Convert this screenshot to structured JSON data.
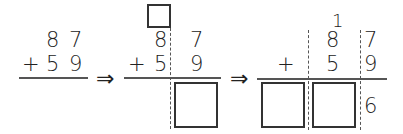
{
  "panel1": {
    "top_digits": [
      "8",
      "7"
    ],
    "operator": "+",
    "bottom_digits": [
      "5",
      "9"
    ]
  },
  "arrow1": "⇒",
  "panel2": {
    "carry_box": "",
    "top_digits": [
      "8",
      "7"
    ],
    "operator": "+",
    "bottom_digits": [
      "5",
      "9"
    ],
    "answer_box": ""
  },
  "arrow2": "⇒",
  "panel3": {
    "carry": "1",
    "top_digits": [
      "8",
      "7"
    ],
    "operator": "+",
    "bottom_digits": [
      "5",
      "9"
    ],
    "answer_boxes": [
      "",
      ""
    ],
    "ones_result": "6"
  }
}
